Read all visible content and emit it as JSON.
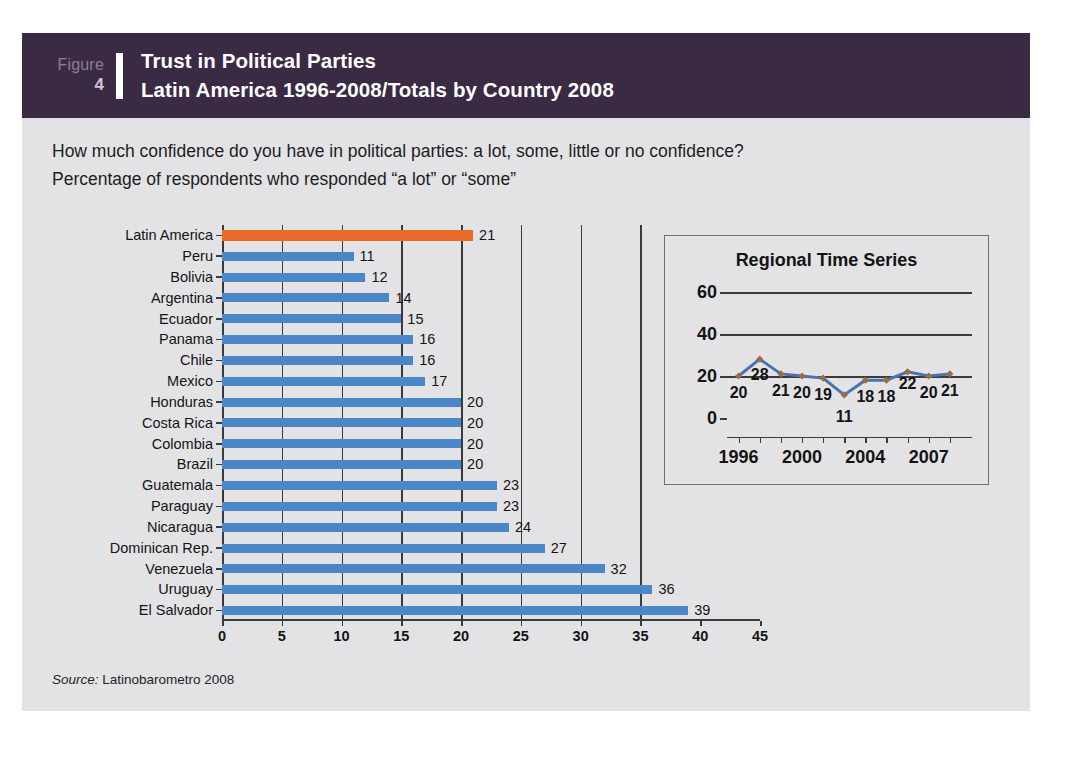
{
  "figure": {
    "word": "Figure",
    "number": "4",
    "title_line1": "Trust in Political Parties",
    "title_line2": "Latin America 1996-2008/Totals by Country 2008",
    "header_bg": "#3b2a43"
  },
  "question": {
    "line1": "How much confidence do you have in political parties: a lot, some, little or no confidence?",
    "line2": "Percentage of respondents who responded “a lot” or “some”"
  },
  "source": {
    "label": "Source:",
    "text": " Latinobarometro 2008"
  },
  "colors": {
    "bar_blue": "#4a86c8",
    "bar_orange": "#ec6a28",
    "line_blue": "#4a72b0",
    "marker_brown": "#9e6b3c",
    "axis": "#3a3a3a",
    "panel_bg": "#e3e3e6"
  },
  "chart_data": [
    {
      "type": "bar",
      "orientation": "horizontal",
      "title": "Trust in Political Parties — Totals by Country 2008",
      "xlabel": "",
      "ylabel": "",
      "xlim": [
        0,
        45
      ],
      "xticks": [
        0,
        5,
        10,
        15,
        20,
        25,
        30,
        35,
        40,
        45
      ],
      "grid": "vertical gridlines at 5,10,15,20,25,30,35",
      "legend": "none",
      "categories": [
        "Latin America",
        "Peru",
        "Bolivia",
        "Argentina",
        "Ecuador",
        "Panama",
        "Chile",
        "Mexico",
        "Honduras",
        "Costa Rica",
        "Colombia",
        "Brazil",
        "Guatemala",
        "Paraguay",
        "Nicaragua",
        "Dominican Rep.",
        "Venezuela",
        "Uruguay",
        "El Salvador"
      ],
      "values": [
        21,
        11,
        12,
        14,
        15,
        16,
        16,
        17,
        20,
        20,
        20,
        20,
        23,
        23,
        24,
        27,
        32,
        36,
        39
      ],
      "highlight_index": 0
    },
    {
      "type": "line",
      "title": "Regional Time Series",
      "xlabel": "",
      "ylabel": "",
      "ylim": [
        0,
        60
      ],
      "yticks": [
        0,
        20,
        40,
        60
      ],
      "xticks_labeled": [
        "1996",
        "2000",
        "2004",
        "2007"
      ],
      "x": [
        "1996",
        "1997",
        "1998",
        "2000",
        "2001",
        "2003",
        "2004",
        "2005",
        "2006",
        "2007",
        "2008"
      ],
      "values": [
        20,
        28,
        21,
        20,
        19,
        11,
        18,
        18,
        22,
        20,
        21
      ],
      "legend": "none",
      "grid": "horizontal gridlines at 20, 40, 60"
    }
  ]
}
